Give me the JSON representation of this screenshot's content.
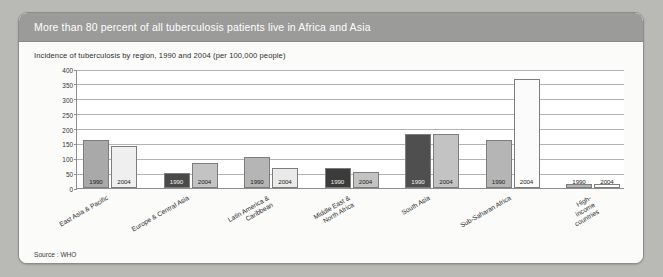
{
  "header": {
    "title": "More than 80 percent of all tuberculosis patients live in Africa and Asia"
  },
  "source": "Source : WHO",
  "colors": {
    "header_band": "#9b9b99",
    "page_background": "#b9b9b5",
    "panel_background": "#fbfbfa",
    "plot_background": "#ffffff",
    "gridline": "#b3b3b3",
    "axis": "#8e8e8e",
    "bar_mid_gray": "#a9a9a9",
    "bar_light_gray": "#c9c9c9",
    "bar_pale": "#efefef",
    "bar_dark": "#3b3b3b",
    "bar_white": "#fbfbfb",
    "bar_outline": "#7d7d7d"
  },
  "chart_data": {
    "type": "bar",
    "title": "More than 80 percent of all tuberculosis patients live in Africa and Asia",
    "subtitle": "Incidence of tuberculosis by region, 1990 and 2004 (per 100,000 people)",
    "xlabel": "",
    "ylabel": "",
    "ylim": [
      0,
      400
    ],
    "yticks": [
      0,
      50,
      100,
      150,
      200,
      250,
      300,
      350,
      400
    ],
    "grid": true,
    "legend_position": "none",
    "series_names": [
      "1990",
      "2004"
    ],
    "categories": [
      "East Asia & Pacific",
      "Europe & Central Asia",
      "Latin America &\nCaribbean",
      "Middle East &\nNorth Africa",
      "South Asia",
      "Sub-Saharan Africa",
      "High-income countries"
    ],
    "series": [
      {
        "name": "1990",
        "values": [
          160,
          52,
          105,
          67,
          180,
          162,
          10
        ]
      },
      {
        "name": "2004",
        "values": [
          140,
          85,
          67,
          53,
          180,
          368,
          5
        ]
      }
    ],
    "bar_fills_1990": [
      "#a9a9a9",
      "#4a4a4a",
      "#b5b5b5",
      "#3b3b3b",
      "#4f4f4f",
      "#b5b5b5",
      "#b5b5b5"
    ],
    "bar_fills_2004": [
      "#efefef",
      "#c3c3c3",
      "#eaeaea",
      "#c3c3c3",
      "#c3c3c3",
      "#fbfbfb",
      "#fdfdfd"
    ]
  }
}
